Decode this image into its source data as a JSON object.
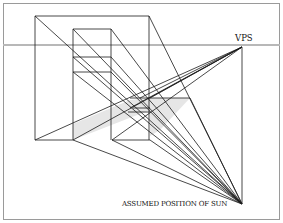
{
  "diagram": {
    "labels": {
      "vps": "VPS",
      "sun": "ASSUMED POSITION OF SUN"
    },
    "colors": {
      "line": "#1a1a1a",
      "horizon": "#b8b8b8",
      "shadow_fill": "#e6e6e6",
      "border": "#9a9a9a",
      "background": "#ffffff"
    },
    "points": {
      "vps": [
        242,
        47
      ],
      "sun": [
        242,
        204
      ]
    },
    "horizon_y": 45
  }
}
